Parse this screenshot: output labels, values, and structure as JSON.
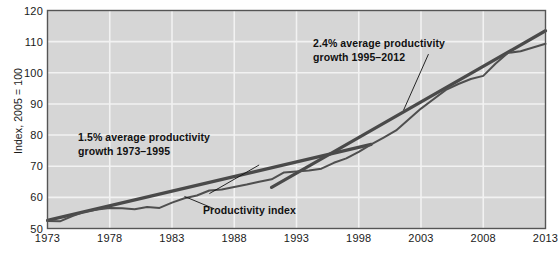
{
  "chart_data": {
    "type": "line",
    "title": "",
    "xlabel": "",
    "ylabel": "Index, 2005 = 100",
    "xlim": [
      1973,
      2013
    ],
    "ylim": [
      50,
      120
    ],
    "grid": true,
    "legend": "none",
    "xticks": [
      "1973",
      "1978",
      "1983",
      "1988",
      "1993",
      "1998",
      "2003",
      "2008",
      "2013"
    ],
    "yticks": [
      "50",
      "60",
      "70",
      "80",
      "90",
      "100",
      "110",
      "120"
    ],
    "series": [
      {
        "name": "Productivity index",
        "x": [
          1973,
          1974,
          1975,
          1976,
          1977,
          1978,
          1979,
          1980,
          1981,
          1982,
          1983,
          1984,
          1985,
          1986,
          1987,
          1988,
          1989,
          1990,
          1991,
          1992,
          1993,
          1994,
          1995,
          1996,
          1997,
          1998,
          1999,
          2000,
          2001,
          2002,
          2003,
          2004,
          2005,
          2006,
          2007,
          2008,
          2009,
          2010,
          2011,
          2012,
          2013
        ],
        "values": [
          52.4,
          52.3,
          54.0,
          55.4,
          56.1,
          56.6,
          56.5,
          56.2,
          56.9,
          56.6,
          58.3,
          59.7,
          60.6,
          62.2,
          62.5,
          63.3,
          64.1,
          65.0,
          65.8,
          68.0,
          68.3,
          68.6,
          69.2,
          71.1,
          72.5,
          74.6,
          77.0,
          79.2,
          81.5,
          85.0,
          88.5,
          91.5,
          94.5,
          96.4,
          98.0,
          99.0,
          103.0,
          106.4,
          106.9,
          108.1,
          109.3
        ]
      },
      {
        "name": "1.5% average productivity growth 1973-1995 trend",
        "x": [
          1973,
          1999
        ],
        "values": [
          52.6,
          77.0
        ]
      },
      {
        "name": "2.4% average productivity growth 1995-2012 trend",
        "x": [
          1991,
          2013
        ],
        "values": [
          63.2,
          113.5
        ]
      }
    ],
    "annotations": [
      {
        "text_line1": "1.5% average productivity",
        "text_line2": "growth 1973–1995",
        "leader_from_x": 1990.0,
        "leader_from_y": 70.4,
        "leader_to_x": 1986.0,
        "leader_to_y": 61.2
      },
      {
        "text_line1": "2.4% average productivity",
        "text_line2": "growth 1995–2012",
        "leader_from_x": 2003.6,
        "leader_from_y": 106.0,
        "leader_to_x": 2001.6,
        "leader_to_y": 88.0
      },
      {
        "text": "Productivity index",
        "leader_from_x": 1986.4,
        "leader_from_y": 56.3,
        "leader_to_x": 1984.0,
        "leader_to_y": 60.3
      }
    ],
    "colors": {
      "plot_background": "#d6d6d6",
      "gridline": "#f2f2f2",
      "plot_border": "#555555",
      "data_line": "#4f4f4f",
      "trend_line": "#4a4a4a",
      "text": "#1a1a1a",
      "page_background": "#ffffff"
    }
  }
}
